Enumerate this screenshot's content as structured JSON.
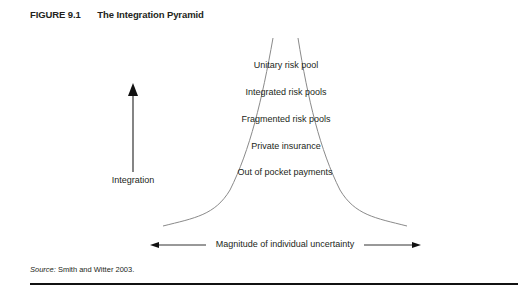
{
  "figure": {
    "number": "FIGURE 9.1",
    "title": "The Integration Pyramid"
  },
  "pyramid_levels": [
    {
      "label": "Unitary risk pool"
    },
    {
      "label": "Integrated risk pools"
    },
    {
      "label": "Fragmented risk pools"
    },
    {
      "label": "Private insurance"
    },
    {
      "label": "Out of pocket payments"
    }
  ],
  "axes": {
    "vertical_label": "Integration",
    "horizontal_label": "Magnitude of individual uncertainty"
  },
  "source": {
    "prefix": "Source:",
    "text": " Smith and Witter 2003."
  },
  "colors": {
    "curve": "#8a8a8a",
    "text": "#231f20",
    "rule": "#111111"
  }
}
